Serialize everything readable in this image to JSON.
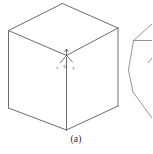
{
  "figure": {
    "caption": "(a)",
    "background_color": "#ffffff",
    "line_color": "#6d6d6d",
    "soft_line_color": "#8a8a8a",
    "axis_color": "#4a4a4a",
    "label_color": "#3b3b3b"
  },
  "axes": {
    "origin_label": "O",
    "x_label": "x",
    "y_label": "y",
    "z_label": "z"
  },
  "shapes": {
    "cube": {
      "name": "cube",
      "top_face_path": "M 8.5 30.5 L 62.5 3.5 L 118 28 L 66.5 55.5 Z",
      "left_face_path": "M 8.5 30.5 L 66.5 55.5 L 66.5 130 L 8.5 108 Z",
      "right_face_path": "M 66.5 55.5 L 118 28 L 118 106 L 66.5 130 Z",
      "front_vertical_edge": "M 66.5 55.5 L 66.5 130"
    },
    "partial_polygon": {
      "name": "partial-polygon-right",
      "path": "M 152 24 L 133.5 40.5 L 152 40.5 M 133.5 40.5 L 128.5 70 L 133 92 L 149 117 L 152 119"
    }
  }
}
